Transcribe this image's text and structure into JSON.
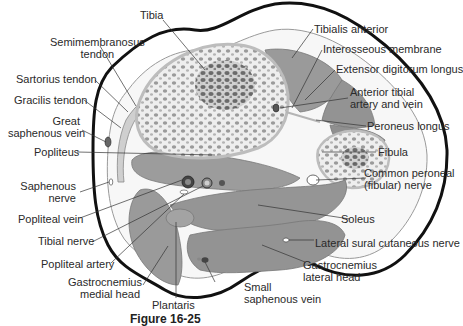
{
  "figure": {
    "caption": "Figure 16-25",
    "colors": {
      "outline": "#111111",
      "muscle": "#9a9a9a",
      "muscle_dark": "#8a8a8a",
      "bone_cortex": "#d2d2d2",
      "bone_trabecular": "#6f6f6f",
      "fascia": "#c8c8c8",
      "leader_line": "#333333",
      "text": "#2a2a2a"
    },
    "labels_left": [
      {
        "id": "semimembranosus",
        "line1": "Semimembranosus",
        "line2": "tendon"
      },
      {
        "id": "tibia",
        "line1": "Tibia"
      },
      {
        "id": "sartorius",
        "line1": "Sartorius tendon"
      },
      {
        "id": "gracilis",
        "line1": "Gracilis tendon"
      },
      {
        "id": "great-saphenous",
        "line1": "Great",
        "line2": "saphenous vein"
      },
      {
        "id": "popliteus",
        "line1": "Popliteus"
      },
      {
        "id": "saphenous-nerve",
        "line1": "Saphenous",
        "line2": "nerve"
      },
      {
        "id": "popliteal-vein",
        "line1": "Popliteal vein"
      },
      {
        "id": "tibial-nerve",
        "line1": "Tibial nerve"
      },
      {
        "id": "popliteal-artery",
        "line1": "Popliteal artery"
      },
      {
        "id": "gastrocnemius-medial",
        "line1": "Gastrocnemius",
        "line2": "medial head"
      }
    ],
    "labels_right": [
      {
        "id": "tibialis-anterior",
        "line1": "Tibialis anterior"
      },
      {
        "id": "interosseous",
        "line1": "Interosseous membrane"
      },
      {
        "id": "extensor-digitorum",
        "line1": "Extensor digitorum longus"
      },
      {
        "id": "anterior-tibial",
        "line1": "Anterior tibial",
        "line2": "artery and vein"
      },
      {
        "id": "peroneus-longus",
        "line1": "Peroneus longus"
      },
      {
        "id": "fibula",
        "line1": "Fibula"
      },
      {
        "id": "common-peroneal",
        "line1": "Common peroneal",
        "line2": "(fibular) nerve"
      },
      {
        "id": "soleus",
        "line1": "Soleus"
      },
      {
        "id": "lateral-sural",
        "line1": "Lateral sural cutaneous nerve"
      },
      {
        "id": "gastrocnemius-lateral",
        "line1": "Gastrocnemius",
        "line2": "lateral head"
      }
    ],
    "labels_bottom": [
      {
        "id": "plantaris",
        "line1": "Plantaris"
      },
      {
        "id": "small-saphenous",
        "line1": "Small",
        "line2": "saphenous vein"
      }
    ]
  }
}
